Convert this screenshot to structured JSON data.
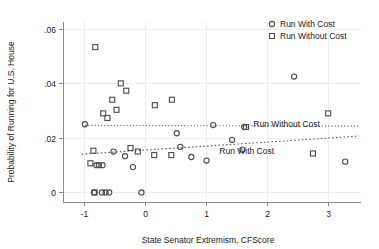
{
  "chart_data": {
    "type": "scatter",
    "title": "",
    "xlabel": "State Senator Extremism, CFScore",
    "ylabel": "Probability of Running for U.S. House",
    "xlim": [
      -1.35,
      3.55
    ],
    "ylim": [
      -0.0035,
      0.0625
    ],
    "xticks": [
      -1,
      0,
      1,
      2,
      3
    ],
    "xticklabels": [
      "-1",
      "0",
      "1",
      "2",
      "3"
    ],
    "yticks": [
      0,
      0.02,
      0.04,
      0.06
    ],
    "yticklabels": [
      "0",
      ".02",
      ".04",
      ".06"
    ],
    "grid": true,
    "legend_position": "top-right",
    "legend": [
      {
        "label": "Run With Cost",
        "marker": "circle"
      },
      {
        "label": "Run Without Cost",
        "marker": "square"
      }
    ],
    "annotations": [
      {
        "text": "Run Without Cost",
        "x": 1.78,
        "y": 0.0252
      },
      {
        "text": "Run With Cost",
        "x": 1.22,
        "y": 0.0152
      }
    ],
    "series": [
      {
        "name": "Run With Cost",
        "marker": "circle",
        "points": [
          {
            "x": -0.99,
            "y": 0.025
          },
          {
            "x": -0.52,
            "y": 0.015
          },
          {
            "x": -0.8,
            "y": 0.01
          },
          {
            "x": -0.76,
            "y": 0.01
          },
          {
            "x": -0.7,
            "y": 0.01
          },
          {
            "x": -0.33,
            "y": 0.0133
          },
          {
            "x": -0.2,
            "y": 0.0093
          },
          {
            "x": 0.58,
            "y": 0.0167
          },
          {
            "x": 0.76,
            "y": 0.013
          },
          {
            "x": 1.01,
            "y": 0.0117
          },
          {
            "x": 1.43,
            "y": 0.0193
          },
          {
            "x": 1.63,
            "y": 0.024
          },
          {
            "x": 1.12,
            "y": 0.0247
          },
          {
            "x": 0.52,
            "y": 0.0217
          },
          {
            "x": 1.6,
            "y": 0.0157
          },
          {
            "x": -0.84,
            "y": 0.0
          },
          {
            "x": -0.71,
            "y": 0.0
          },
          {
            "x": -0.65,
            "y": 0.0
          },
          {
            "x": -0.59,
            "y": 0.0
          },
          {
            "x": -0.06,
            "y": 0.0
          },
          {
            "x": 3.29,
            "y": 0.0113
          },
          {
            "x": 2.45,
            "y": 0.0425
          }
        ]
      },
      {
        "name": "Run Without Cost",
        "marker": "square",
        "points": [
          {
            "x": -0.82,
            "y": 0.0533
          },
          {
            "x": -0.4,
            "y": 0.04
          },
          {
            "x": -0.31,
            "y": 0.0373
          },
          {
            "x": -0.54,
            "y": 0.034
          },
          {
            "x": -0.47,
            "y": 0.0303
          },
          {
            "x": -0.69,
            "y": 0.029
          },
          {
            "x": -0.62,
            "y": 0.0273
          },
          {
            "x": 0.16,
            "y": 0.032
          },
          {
            "x": 0.44,
            "y": 0.034
          },
          {
            "x": -0.85,
            "y": 0.0153
          },
          {
            "x": -0.24,
            "y": 0.0163
          },
          {
            "x": -0.12,
            "y": 0.015
          },
          {
            "x": 0.15,
            "y": 0.0137
          },
          {
            "x": 0.43,
            "y": 0.0137
          },
          {
            "x": -0.9,
            "y": 0.0107
          },
          {
            "x": -0.83,
            "y": 0.0
          },
          {
            "x": 1.66,
            "y": 0.024
          },
          {
            "x": 2.76,
            "y": 0.0143
          },
          {
            "x": 3.01,
            "y": 0.029
          }
        ]
      }
    ],
    "fit_lines": [
      {
        "name": "Run Without Cost",
        "style": "dotted",
        "x0": -1.04,
        "y0": 0.0246,
        "x1": 3.52,
        "y1": 0.0243
      },
      {
        "name": "Run With Cost",
        "style": "dashed-dotted",
        "x0": -1.04,
        "y0": 0.014,
        "x1": 3.52,
        "y1": 0.0207
      }
    ]
  }
}
